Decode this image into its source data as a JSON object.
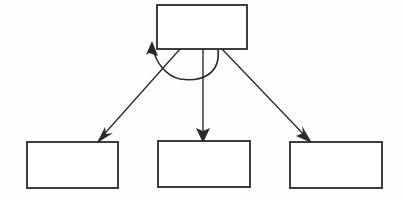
{
  "diagram": {
    "type": "node-link-diagram",
    "canvas": {
      "width": 404,
      "height": 201
    },
    "style": {
      "background_color": "#fdfdfd",
      "stroke_color": "#2a2a2a",
      "node_fill_color": "#ffffff",
      "stroke_width": 1.6
    },
    "nodes": [
      {
        "id": "top",
        "name": "top-node",
        "label": "",
        "x": 157,
        "y": 5,
        "width": 90,
        "height": 44
      },
      {
        "id": "bottom-left",
        "name": "bottom-left-node",
        "label": "",
        "x": 27,
        "y": 142,
        "width": 91,
        "height": 46
      },
      {
        "id": "bottom-middle",
        "name": "bottom-middle-node",
        "label": "",
        "x": 158,
        "y": 141,
        "width": 92,
        "height": 46
      },
      {
        "id": "bottom-right",
        "name": "bottom-right-node",
        "label": "",
        "x": 290,
        "y": 142,
        "width": 92,
        "height": 46
      }
    ],
    "edges": [
      {
        "id": "edge-top-to-bottom-left",
        "name": "edge-top-to-bottom-left",
        "from": "top",
        "to": "bottom-left",
        "label": "",
        "kind": "straight",
        "path": "M 180 49 L 99 140",
        "arrow": {
          "tip_x": 99,
          "tip_y": 141,
          "angle_deg": 131
        }
      },
      {
        "id": "edge-top-to-bottom-middle",
        "name": "edge-top-to-bottom-middle",
        "from": "top",
        "to": "bottom-middle",
        "label": "",
        "kind": "straight",
        "path": "M 203 49 L 203 139",
        "arrow": {
          "tip_x": 203,
          "tip_y": 141,
          "angle_deg": 90
        }
      },
      {
        "id": "edge-top-to-bottom-right",
        "name": "edge-top-to-bottom-right",
        "from": "top",
        "to": "bottom-right",
        "label": "",
        "kind": "straight",
        "path": "M 222 49 L 309 140",
        "arrow": {
          "tip_x": 310,
          "tip_y": 141,
          "angle_deg": 46
        }
      },
      {
        "id": "edge-top-self-loop",
        "name": "edge-top-self-loop",
        "from": "top",
        "to": "top",
        "label": "",
        "kind": "self-loop-arc",
        "path": "M 218 49 C 221 76 199 82 180 79 C 166 76 155 62 153 47",
        "arrow": {
          "tip_x": 152,
          "tip_y": 42,
          "angle_deg": -99
        }
      }
    ]
  }
}
